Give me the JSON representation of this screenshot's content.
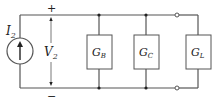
{
  "diagram": {
    "type": "circuit",
    "colors": {
      "wire": "#555555",
      "text": "#222222",
      "background": "#ffffff"
    },
    "source": {
      "label": "I",
      "subscript": "2",
      "kind": "current-source",
      "direction": "up"
    },
    "voltage": {
      "label": "V",
      "subscript": "2",
      "plus": "+",
      "minus": "−"
    },
    "conductances": [
      {
        "label": "G",
        "subscript": "B"
      },
      {
        "label": "G",
        "subscript": "C"
      },
      {
        "label": "G",
        "subscript": "L"
      }
    ]
  }
}
